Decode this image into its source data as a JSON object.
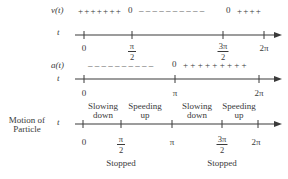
{
  "rows": [
    {
      "id": "velocity",
      "function_label": "v(t)",
      "var_label": "t",
      "sign_segments": [
        "+++++++",
        "0",
        "– – – – – – – – – –",
        "0",
        "++++"
      ],
      "ticks": [
        {
          "label": "0"
        },
        {
          "num": "π",
          "den": "2"
        },
        {
          "num": "3π",
          "den": "2"
        },
        {
          "label": "2π"
        }
      ]
    },
    {
      "id": "acceleration",
      "function_label": "a(t)",
      "var_label": "t",
      "sign_segments": [
        "– – – – – – – – – –",
        "0",
        "+ + + + + + + + +"
      ],
      "ticks": [
        {
          "label": "0"
        },
        {
          "label": "π"
        },
        {
          "label": "2π"
        }
      ]
    },
    {
      "id": "motion",
      "row_label_line1": "Motion of",
      "row_label_line2": "Particle",
      "var_label": "t",
      "intervals": [
        {
          "line1": "Slowing",
          "line2": "down"
        },
        {
          "line1": "Speeding",
          "line2": "up"
        },
        {
          "line1": "Slowing",
          "line2": "down"
        },
        {
          "line1": "Speeding",
          "line2": "up"
        }
      ],
      "ticks": [
        {
          "label": "0"
        },
        {
          "num": "π",
          "den": "2"
        },
        {
          "label": "π"
        },
        {
          "num": "3π",
          "den": "2"
        },
        {
          "label": "2π"
        }
      ],
      "stopped_labels": [
        "Stopped",
        "Stopped"
      ]
    }
  ],
  "colors": {
    "ink": "#3a3a3a",
    "background": "#ffffff"
  }
}
